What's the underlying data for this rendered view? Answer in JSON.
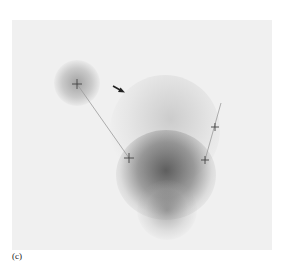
{
  "figure": {
    "panel_label": "(c)",
    "background_color": "#f0f0f0",
    "markers": [
      {
        "x": 77,
        "y": 84
      },
      {
        "x": 129,
        "y": 158
      },
      {
        "x": 205,
        "y": 160
      },
      {
        "x": 215,
        "y": 127
      }
    ],
    "lines": [
      {
        "from": [
          77,
          84
        ],
        "to": [
          129,
          158
        ]
      },
      {
        "from": [
          205,
          160
        ],
        "to": [
          221,
          103
        ]
      }
    ],
    "arrow": {
      "from": [
        113,
        86
      ],
      "to": [
        124,
        92
      ],
      "color": "#222222"
    }
  }
}
